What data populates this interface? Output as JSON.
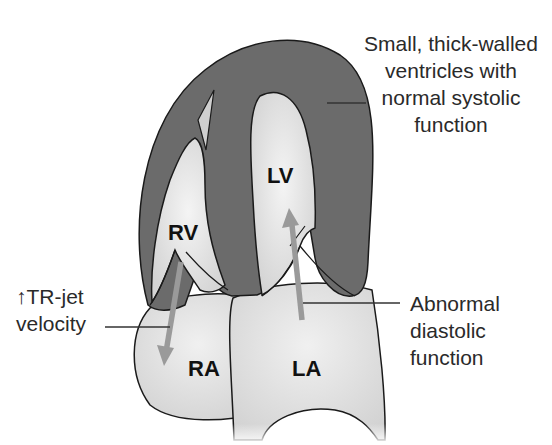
{
  "colors": {
    "background": "#ffffff",
    "myocardium": "#6b6b6b",
    "chamber_fill": "#dcdcdc",
    "chamber_highlight": "#f2f2f2",
    "outline": "#1a1a1a",
    "flow_arrow": "#9a9a9a",
    "leader_line": "#333333",
    "text": "#2a2a2a"
  },
  "chambers": {
    "rv": "RV",
    "lv": "LV",
    "ra": "RA",
    "la": "LA"
  },
  "callouts": {
    "ventricles": {
      "lines": [
        "Small, thick-walled",
        "ventricles with",
        "normal systolic",
        "function"
      ]
    },
    "tr_jet": {
      "arrow_symbol": "↑",
      "lines": [
        "TR-jet",
        "velocity"
      ]
    },
    "diastolic": {
      "lines": [
        "Abnormal",
        "diastolic",
        "function"
      ]
    }
  }
}
